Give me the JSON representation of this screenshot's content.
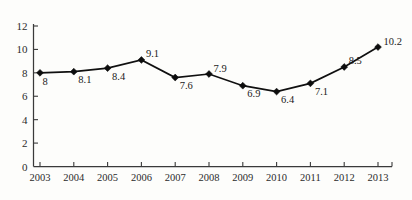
{
  "chart_data": {
    "type": "line",
    "title": "",
    "subtitle": "",
    "xlabel": "",
    "ylabel": "",
    "categories": [
      "2003",
      "2004",
      "2005",
      "2006",
      "2007",
      "2008",
      "2009",
      "2010",
      "2011",
      "2012",
      "2013"
    ],
    "values": [
      8,
      8.1,
      8.4,
      9.1,
      7.6,
      7.9,
      6.9,
      6.4,
      7.1,
      8.5,
      10.2
    ],
    "point_labels": [
      "8",
      "8.1",
      "8.4",
      "9.1",
      "7.6",
      "7.9",
      "6.9",
      "6.4",
      "7.1",
      "8.5",
      "10.2"
    ],
    "label_positions": [
      "below",
      "below",
      "below",
      "above",
      "below",
      "above",
      "below",
      "below",
      "below",
      "above",
      "above"
    ],
    "series": [
      {
        "name": "",
        "values": [
          8,
          8.1,
          8.4,
          9.1,
          7.6,
          7.9,
          6.9,
          6.4,
          7.1,
          8.5,
          10.2
        ]
      }
    ],
    "ylim": [
      0,
      12
    ],
    "yticks": [
      0,
      2,
      4,
      6,
      8,
      10,
      12
    ],
    "ytick_labels": [
      "0",
      "2",
      "4",
      "6",
      "8",
      "10",
      "12"
    ],
    "xtick_labels": [
      "2003",
      "2004",
      "2005",
      "2006",
      "2007",
      "2008",
      "2009",
      "2010",
      "2011",
      "2012",
      "2013"
    ],
    "grid": false,
    "legend": false,
    "legend_position": "none",
    "marker": "diamond",
    "line_color": "#101010",
    "marker_color": "#0d0d0d",
    "axis_color": "#3a3a3a"
  }
}
